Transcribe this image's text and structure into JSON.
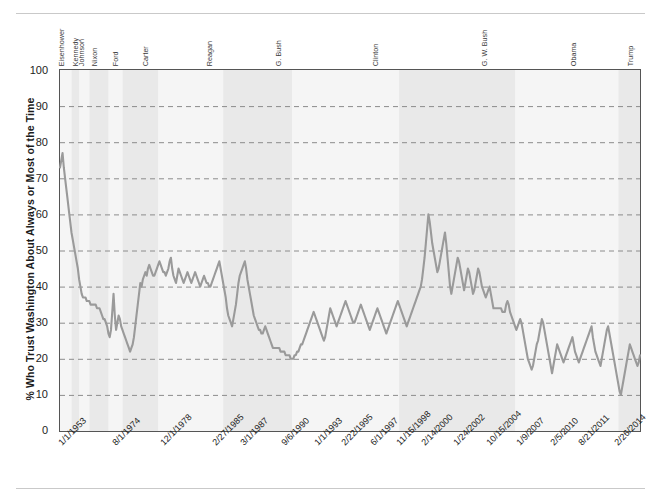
{
  "figure": {
    "kind": "line-chart-figure",
    "has_top_rule": true,
    "has_bottom_rule": true
  },
  "colors": {
    "line": "#9a9a9a",
    "band": "#e8e8e8",
    "grid": "#8c8c8c",
    "axis": "#555555",
    "text": "#1c1c1c",
    "background": "#ffffff"
  },
  "chart_data": {
    "type": "line",
    "title": "",
    "subtitle": "",
    "xlabel": "",
    "ylabel": "% Who Trust Washington About Always or Most of the Time",
    "ylim": [
      0,
      100
    ],
    "ytick_labels": [
      "0",
      "10",
      "20",
      "30",
      "40",
      "50",
      "60",
      "70",
      "80",
      "90",
      "100"
    ],
    "ytick_values": [
      0,
      10,
      20,
      30,
      40,
      50,
      60,
      70,
      80,
      90,
      100
    ],
    "grid": "horizontal-dashed",
    "legend": "none",
    "legend_position": "none",
    "xtick_labels": [
      "1/1/1953",
      "8/1/1974",
      "12/1/1978",
      "2/27/1985",
      "3/1/1987",
      "9/6/1990",
      "1/1/1993",
      "2/22/1995",
      "6/1/1997",
      "11/15/1998",
      "2/14/2000",
      "1/24/2002",
      "10/15/2004",
      "1/9/2007",
      "2/5/2010",
      "8/21/2011",
      "2/26/2014"
    ],
    "xtick_positions": [
      0,
      42,
      80,
      121,
      143,
      175,
      201,
      222,
      245,
      265,
      285,
      310,
      336,
      359,
      386,
      408,
      436
    ],
    "annotations": [
      {
        "label": "Eisenhower",
        "x_index": 2
      },
      {
        "label": "Kennedy",
        "x_index": 13
      },
      {
        "label": "Johnson",
        "x_index": 18
      },
      {
        "label": "Nixon",
        "x_index": 28
      },
      {
        "label": "Ford",
        "x_index": 44
      },
      {
        "label": "Carter",
        "x_index": 68
      },
      {
        "label": "Reagan",
        "x_index": 118
      },
      {
        "label": "G. Bush",
        "x_index": 172
      },
      {
        "label": "Clinton",
        "x_index": 248
      },
      {
        "label": "G. W. Bush",
        "x_index": 334
      },
      {
        "label": "Obama",
        "x_index": 404
      },
      {
        "label": "Trump",
        "x_index": 448
      }
    ],
    "shaded_bands": [
      {
        "label": "Eisenhower",
        "start": 0,
        "end": 9,
        "shade": "light"
      },
      {
        "label": "Kennedy",
        "start": 9,
        "end": 15,
        "shade": "dark"
      },
      {
        "label": "Johnson",
        "start": 15,
        "end": 23,
        "shade": "light"
      },
      {
        "label": "Nixon",
        "start": 23,
        "end": 38,
        "shade": "dark"
      },
      {
        "label": "Ford",
        "start": 38,
        "end": 49,
        "shade": "light"
      },
      {
        "label": "Carter",
        "start": 49,
        "end": 77,
        "shade": "dark"
      },
      {
        "label": "Reagan",
        "start": 77,
        "end": 128,
        "shade": "light"
      },
      {
        "label": "G. Bush",
        "start": 128,
        "end": 182,
        "shade": "dark"
      },
      {
        "label": "Clinton",
        "start": 182,
        "end": 266,
        "shade": "light"
      },
      {
        "label": "G. W. Bush",
        "start": 266,
        "end": 357,
        "shade": "dark"
      },
      {
        "label": "Obama",
        "start": 357,
        "end": 438,
        "shade": "light"
      },
      {
        "label": "Trump",
        "start": 438,
        "end": 455,
        "shade": "dark"
      }
    ],
    "x": [
      0,
      1,
      2,
      3,
      4,
      5,
      6,
      7,
      8,
      9,
      10,
      11,
      12,
      13,
      14,
      15,
      16,
      17,
      18,
      19,
      20,
      21,
      22,
      23,
      24,
      25,
      26,
      27,
      28,
      29,
      30,
      31,
      32,
      33,
      34,
      35,
      36,
      37,
      38,
      39,
      40,
      41,
      42,
      43,
      44,
      45,
      46,
      47,
      48,
      49,
      50,
      51,
      52,
      53,
      54,
      55,
      56,
      57,
      58,
      59,
      60,
      61,
      62,
      63,
      64,
      65,
      66,
      67,
      68,
      69,
      70,
      71,
      72,
      73,
      74,
      75,
      76,
      77,
      78,
      79,
      80,
      81,
      82,
      83,
      84,
      85,
      86,
      87,
      88,
      89,
      90,
      91,
      92,
      93,
      94,
      95,
      96,
      97,
      98,
      99,
      100,
      101,
      102,
      103,
      104,
      105,
      106,
      107,
      108,
      109,
      110,
      111,
      112,
      113,
      114,
      115,
      116,
      117,
      118,
      119,
      120,
      121,
      122,
      123,
      124,
      125,
      126,
      127,
      128,
      129,
      130,
      131,
      132,
      133,
      134,
      135,
      136,
      137,
      138,
      139,
      140,
      141,
      142,
      143,
      144,
      145,
      146,
      147,
      148,
      149,
      150,
      151,
      152,
      153,
      154,
      155,
      156,
      157,
      158,
      159,
      160,
      161,
      162,
      163,
      164,
      165,
      166,
      167,
      168,
      169,
      170,
      171,
      172,
      173,
      174,
      175,
      176,
      177,
      178,
      179,
      180,
      181,
      182,
      183,
      184,
      185,
      186,
      187,
      188,
      189,
      190,
      191,
      192,
      193,
      194,
      195,
      196,
      197,
      198,
      199,
      200,
      201,
      202,
      203,
      204,
      205,
      206,
      207,
      208,
      209,
      210,
      211,
      212,
      213,
      214,
      215,
      216,
      217,
      218,
      219,
      220,
      221,
      222,
      223,
      224,
      225,
      226,
      227,
      228,
      229,
      230,
      231,
      232,
      233,
      234,
      235,
      236,
      237,
      238,
      239,
      240,
      241,
      242,
      243,
      244,
      245,
      246,
      247,
      248,
      249,
      250,
      251,
      252,
      253,
      254,
      255,
      256,
      257,
      258,
      259,
      260,
      261,
      262,
      263,
      264,
      265,
      266,
      267,
      268,
      269,
      270,
      271,
      272,
      273,
      274,
      275,
      276,
      277,
      278,
      279,
      280,
      281,
      282,
      283,
      284,
      285,
      286,
      287,
      288,
      289,
      290,
      291,
      292,
      293,
      294,
      295,
      296,
      297,
      298,
      299,
      300,
      301,
      302,
      303,
      304,
      305,
      306,
      307,
      308,
      309,
      310,
      311,
      312,
      313,
      314,
      315,
      316,
      317,
      318,
      319,
      320,
      321,
      322,
      323,
      324,
      325,
      326,
      327,
      328,
      329,
      330,
      331,
      332,
      333,
      334,
      335,
      336,
      337,
      338,
      339,
      340,
      341,
      342,
      343,
      344,
      345,
      346,
      347,
      348,
      349,
      350,
      351,
      352,
      353,
      354,
      355,
      356,
      357,
      358,
      359,
      360,
      361,
      362,
      363,
      364,
      365,
      366,
      367,
      368,
      369,
      370,
      371,
      372,
      373,
      374,
      375,
      376,
      377,
      378,
      379,
      380,
      381,
      382,
      383,
      384,
      385,
      386,
      387,
      388,
      389,
      390,
      391,
      392,
      393,
      394,
      395,
      396,
      397,
      398,
      399,
      400,
      401,
      402,
      403,
      404,
      405,
      406,
      407,
      408,
      409,
      410,
      411,
      412,
      413,
      414,
      415,
      416,
      417,
      418,
      419,
      420,
      421,
      422,
      423,
      424,
      425,
      426,
      427,
      428,
      429,
      430,
      431,
      432,
      433,
      434,
      435,
      436,
      437,
      438,
      439,
      440,
      441,
      442,
      443,
      444,
      445,
      446,
      447,
      448,
      449,
      450,
      451,
      452,
      453,
      454,
      455
    ],
    "y": [
      73,
      75,
      77,
      73,
      70,
      67,
      64,
      61,
      58,
      55,
      53,
      51,
      49,
      47,
      45,
      42,
      40,
      38,
      37,
      37,
      37,
      36,
      36,
      36,
      35,
      35,
      35,
      35,
      35,
      34,
      34,
      34,
      33,
      32,
      31,
      31,
      30,
      29,
      27,
      26,
      28,
      33,
      38,
      32,
      28,
      30,
      32,
      31,
      29,
      28,
      27,
      26,
      25,
      24,
      23,
      22,
      23,
      24,
      26,
      29,
      32,
      35,
      38,
      41,
      40,
      42,
      43,
      44,
      43,
      45,
      46,
      45,
      44,
      43,
      43,
      44,
      45,
      46,
      47,
      46,
      45,
      44,
      44,
      43,
      44,
      45,
      47,
      48,
      45,
      43,
      42,
      41,
      43,
      45,
      44,
      43,
      42,
      41,
      42,
      43,
      44,
      43,
      42,
      41,
      42,
      43,
      44,
      43,
      42,
      41,
      40,
      41,
      42,
      43,
      42,
      41,
      41,
      40,
      40,
      41,
      42,
      43,
      44,
      45,
      46,
      47,
      45,
      43,
      41,
      39,
      37,
      34,
      32,
      31,
      30,
      29,
      31,
      33,
      35,
      38,
      41,
      43,
      44,
      45,
      46,
      47,
      45,
      42,
      40,
      38,
      36,
      34,
      32,
      31,
      30,
      29,
      28,
      28,
      27,
      27,
      28,
      29,
      28,
      27,
      26,
      25,
      24,
      23,
      23,
      23,
      23,
      23,
      23,
      22,
      22,
      22,
      22,
      21,
      21,
      21,
      21,
      20,
      20,
      20,
      21,
      21,
      22,
      22,
      23,
      24,
      24,
      25,
      26,
      27,
      28,
      29,
      30,
      31,
      32,
      33,
      32,
      31,
      30,
      29,
      28,
      27,
      26,
      25,
      26,
      28,
      30,
      32,
      34,
      33,
      32,
      31,
      30,
      29,
      30,
      31,
      32,
      33,
      34,
      35,
      36,
      35,
      34,
      33,
      32,
      31,
      30,
      30,
      31,
      32,
      33,
      34,
      35,
      34,
      33,
      32,
      31,
      30,
      29,
      28,
      29,
      30,
      31,
      32,
      33,
      34,
      33,
      32,
      31,
      30,
      29,
      28,
      27,
      28,
      29,
      30,
      31,
      32,
      33,
      34,
      35,
      36,
      35,
      34,
      33,
      32,
      31,
      30,
      29,
      30,
      31,
      32,
      33,
      34,
      35,
      36,
      37,
      38,
      39,
      40,
      42,
      45,
      48,
      52,
      56,
      60,
      58,
      55,
      52,
      50,
      48,
      46,
      44,
      45,
      47,
      49,
      51,
      53,
      55,
      52,
      48,
      44,
      40,
      38,
      40,
      42,
      44,
      46,
      48,
      47,
      45,
      43,
      41,
      39,
      41,
      43,
      45,
      44,
      42,
      40,
      38,
      39,
      41,
      43,
      45,
      44,
      42,
      40,
      39,
      38,
      37,
      38,
      39,
      40,
      38,
      36,
      34,
      34,
      34,
      34,
      34,
      34,
      34,
      33,
      33,
      33,
      35,
      36,
      35,
      33,
      32,
      31,
      30,
      29,
      28,
      29,
      30,
      31,
      30,
      28,
      26,
      24,
      22,
      20,
      19,
      18,
      17,
      18,
      20,
      22,
      24,
      25,
      27,
      29,
      31,
      30,
      28,
      26,
      24,
      22,
      20,
      18,
      16,
      18,
      20,
      22,
      24,
      23,
      22,
      21,
      20,
      19,
      20,
      21,
      22,
      23,
      24,
      25,
      26,
      24,
      22,
      21,
      20,
      19,
      20,
      21,
      22,
      23,
      24,
      25,
      26,
      27,
      28,
      29,
      26,
      24,
      22,
      21,
      20,
      19,
      18,
      20,
      22,
      24,
      26,
      28,
      29,
      27,
      25,
      23,
      21,
      19,
      17,
      15,
      13,
      11,
      10,
      12,
      14,
      16,
      18,
      20,
      22,
      24,
      23,
      22,
      21,
      20,
      19,
      18,
      19,
      21,
      23,
      25,
      24,
      22,
      20,
      18,
      17,
      16,
      18,
      20,
      22,
      24,
      22,
      20,
      19,
      18,
      20,
      22,
      20,
      19,
      18,
      19,
      20,
      19,
      18,
      19
    ]
  },
  "axis": {
    "y_tick_0": "0",
    "y_tick_10": "10",
    "y_tick_20": "20",
    "y_tick_30": "30",
    "y_tick_40": "40",
    "y_tick_50": "50",
    "y_tick_60": "60",
    "y_tick_70": "70",
    "y_tick_80": "80",
    "y_tick_90": "90",
    "y_tick_100": "100"
  }
}
